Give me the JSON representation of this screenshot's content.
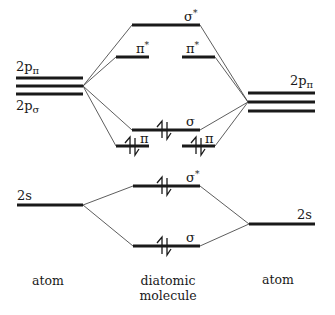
{
  "diagram": {
    "type": "molecular-orbital-energy-level-diagram",
    "left_atom": {
      "p_levels_label_top": {
        "base": "2p",
        "sub": "π"
      },
      "p_levels_label_bottom": {
        "base": "2p",
        "sub": "σ"
      },
      "s_level_label": "2s",
      "p_level_count": 3
    },
    "right_atom": {
      "p_levels_label": {
        "base": "2p",
        "sub": "π"
      },
      "s_level_label": "2s",
      "p_level_count": 3
    },
    "molecule_levels": [
      {
        "id": "sigma-star-2p",
        "symbol": "σ",
        "star": "*",
        "electrons": ""
      },
      {
        "id": "pi-star-2p-left",
        "symbol": "π",
        "star": "*",
        "electrons": ""
      },
      {
        "id": "pi-star-2p-right",
        "symbol": "π",
        "star": "*",
        "electrons": ""
      },
      {
        "id": "sigma-2p",
        "symbol": "σ",
        "star": "",
        "electrons": "↿⇂"
      },
      {
        "id": "pi-2p-left",
        "symbol": "π",
        "star": "",
        "electrons": "↿⇂"
      },
      {
        "id": "pi-2p-right",
        "symbol": "π",
        "star": "",
        "electrons": "↿⇂"
      },
      {
        "id": "sigma-star-2s",
        "symbol": "σ",
        "star": "*",
        "electrons": "↿⇂"
      },
      {
        "id": "sigma-2s",
        "symbol": "σ",
        "star": "",
        "electrons": "↿⇂"
      }
    ],
    "footer": {
      "left": "atom",
      "center_line1": "diatomic",
      "center_line2": "molecule",
      "right": "atom"
    }
  }
}
